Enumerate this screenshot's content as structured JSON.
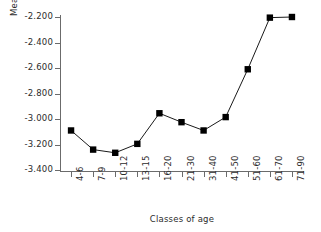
{
  "chart_data": {
    "type": "line",
    "title": "",
    "xlabel": "Classes of age",
    "ylabel": "Mean visual threshold (log10 lux)",
    "ylabel_prefix": "Mean visual threshold (log",
    "ylabel_sub": "10",
    "ylabel_suffix": " lux)",
    "categories": [
      "4-6",
      "7-9",
      "10-12",
      "13-15",
      "16-20",
      "21-30",
      "31-40",
      "41-50",
      "51-60",
      "61-70",
      "71-90"
    ],
    "values": [
      -3.09,
      -3.24,
      -3.265,
      -3.195,
      -2.955,
      -3.025,
      -3.09,
      -2.985,
      -2.61,
      -2.205,
      -2.2
    ],
    "ylim": [
      -3.4,
      -2.2
    ],
    "yticks": [
      -2.2,
      -2.4,
      -2.6,
      -2.8,
      -3.0,
      -3.2,
      -3.4
    ],
    "ytick_labels": [
      "-2.200",
      "-2.400",
      "-2.600",
      "-2.800",
      "-3.000",
      "-3.200",
      "-3.400"
    ],
    "grid": false,
    "legend": false,
    "marker": "filled-square",
    "line_color": "#1a1a1a",
    "marker_color": "#000000",
    "axis_color": "#6b6b6b"
  }
}
